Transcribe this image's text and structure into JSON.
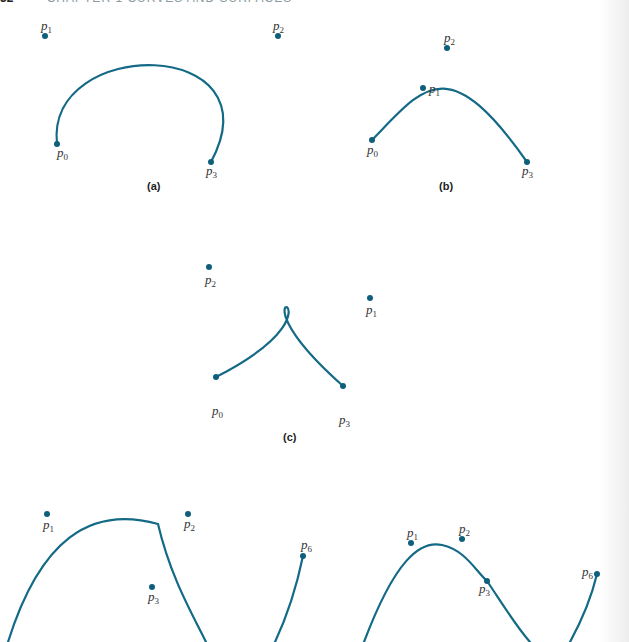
{
  "running_head": {
    "page_number": "32",
    "chapter_text": "CHAPTER 1 CURVES AND SURFACES"
  },
  "colors": {
    "curve": "#146a86",
    "point": "#0f5f7c",
    "text": "#333333"
  },
  "panels": [
    {
      "id": "a",
      "caption": "(a)",
      "points": [
        {
          "name": "p",
          "sub": "0",
          "x": 57,
          "y": 144
        },
        {
          "name": "p",
          "sub": "1",
          "x": 45,
          "y": 36
        },
        {
          "name": "p",
          "sub": "2",
          "x": 278,
          "y": 36
        },
        {
          "name": "p",
          "sub": "3",
          "x": 211,
          "y": 162
        }
      ]
    },
    {
      "id": "b",
      "caption": "(b)",
      "points": [
        {
          "name": "p",
          "sub": "0",
          "x": 372,
          "y": 140
        },
        {
          "name": "p",
          "sub": "1",
          "x": 423,
          "y": 88
        },
        {
          "name": "p",
          "sub": "2",
          "x": 447,
          "y": 48
        },
        {
          "name": "p",
          "sub": "3",
          "x": 527,
          "y": 162
        }
      ]
    },
    {
      "id": "c",
      "caption": "(c)",
      "points": [
        {
          "name": "p",
          "sub": "0",
          "x": 216,
          "y": 377
        },
        {
          "name": "p",
          "sub": "1",
          "x": 370,
          "y": 298
        },
        {
          "name": "p",
          "sub": "2",
          "x": 209,
          "y": 267
        },
        {
          "name": "p",
          "sub": "3",
          "x": 343,
          "y": 386
        }
      ]
    },
    {
      "id": "d",
      "caption": "",
      "points": [
        {
          "name": "p",
          "sub": "1",
          "x": 47,
          "y": 514
        },
        {
          "name": "p",
          "sub": "2",
          "x": 188,
          "y": 514
        },
        {
          "name": "p",
          "sub": "3",
          "x": 152,
          "y": 587
        },
        {
          "name": "p",
          "sub": "6",
          "x": 303,
          "y": 556
        }
      ]
    },
    {
      "id": "e",
      "caption": "",
      "points": [
        {
          "name": "p",
          "sub": "1",
          "x": 411,
          "y": 543
        },
        {
          "name": "p",
          "sub": "2",
          "x": 462,
          "y": 539
        },
        {
          "name": "p",
          "sub": "3",
          "x": 487,
          "y": 581
        },
        {
          "name": "p",
          "sub": "6",
          "x": 597,
          "y": 574
        }
      ]
    }
  ]
}
